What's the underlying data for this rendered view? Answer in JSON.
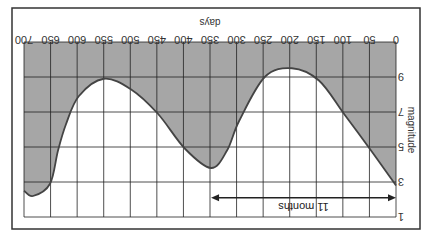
{
  "chart_data": {
    "type": "line",
    "orientation_note": "figure displayed rotated 180 degrees",
    "title": "",
    "xlabel": "days",
    "ylabel": "magnitude",
    "x_ticks": [
      0,
      50,
      100,
      150,
      200,
      250,
      300,
      350,
      400,
      450,
      500,
      550,
      600,
      650,
      700
    ],
    "y_ticks": [
      1,
      3,
      5,
      7,
      9
    ],
    "xlim": [
      0,
      700
    ],
    "ylim": [
      1,
      11
    ],
    "y_inverted": true,
    "grid": true,
    "fill_above_curve": true,
    "series": [
      {
        "name": "light curve",
        "x": [
          0,
          47,
          98,
          145,
          196,
          247,
          295,
          318,
          348,
          397,
          448,
          499,
          550,
          597,
          621,
          636,
          651,
          683,
          700
        ],
        "y": [
          2.8,
          4.8,
          6.9,
          8.8,
          9.5,
          9.0,
          6.5,
          4.8,
          3.8,
          4.9,
          6.9,
          8.3,
          8.9,
          7.9,
          6.3,
          4.8,
          2.9,
          2.2,
          2.5
        ]
      }
    ],
    "annotations": [
      {
        "text": "11 months",
        "type": "double-arrow",
        "x_start": 0,
        "x_end": 348,
        "y": 2.1
      }
    ]
  },
  "colors": {
    "fill": "#a6a6a6",
    "grid": "#222222",
    "curve": "#444444",
    "frame": "#333333"
  }
}
